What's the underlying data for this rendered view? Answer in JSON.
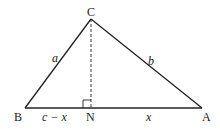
{
  "diagram": {
    "type": "triangle-with-altitude",
    "colors": {
      "stroke": "#222222",
      "background": "#ffffff"
    },
    "vertices": {
      "C": {
        "label": "C",
        "x": 91,
        "y": 19
      },
      "B": {
        "label": "B",
        "x": 25,
        "y": 108
      },
      "A": {
        "label": "A",
        "x": 202,
        "y": 108
      },
      "N": {
        "label": "N",
        "x": 91,
        "y": 108
      }
    },
    "sides": {
      "a": {
        "label": "a",
        "from": "B",
        "to": "C"
      },
      "b": {
        "label": "b",
        "from": "C",
        "to": "A"
      }
    },
    "segments": {
      "BN": {
        "label": "c − x"
      },
      "NA": {
        "label": "x"
      }
    },
    "altitude": {
      "from": "C",
      "to": "N",
      "style": "dashed",
      "right_angle_marker": true
    }
  }
}
